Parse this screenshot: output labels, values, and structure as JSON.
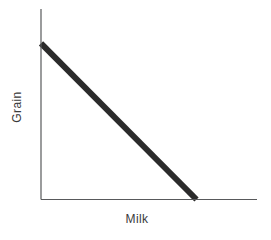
{
  "figure": {
    "background_color": "#ffffff",
    "kind": "scanned textbook economics graph"
  },
  "chart_data": {
    "type": "line",
    "title": "",
    "xlabel": "Milk",
    "ylabel": "Grain",
    "axes": {
      "color": "#58595b",
      "thickness_px": 1.2,
      "ticks": false,
      "tick_labels": [],
      "grid": false,
      "x_range_fraction": [
        0,
        1
      ],
      "y_range_fraction": [
        0,
        1
      ]
    },
    "legend": null,
    "series": [
      {
        "name": "grain-milk linear tradeoff frontier",
        "description": "straight downward-sloping thick line from y-axis to x-axis",
        "points_axis_fraction": [
          {
            "x": 0.0,
            "y": 0.82
          },
          {
            "x": 0.72,
            "y": 0.0
          }
        ],
        "color": "#2b2b2b",
        "thickness_px": 6
      }
    ]
  }
}
